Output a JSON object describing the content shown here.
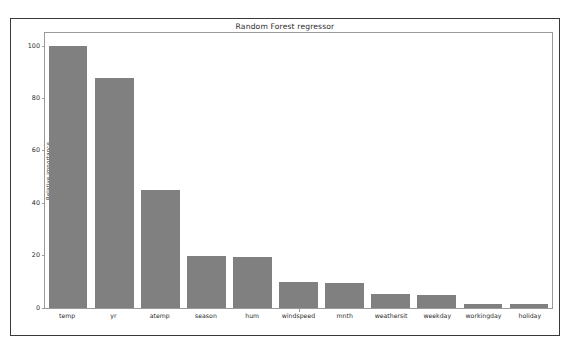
{
  "figure": {
    "title": "Random Forest regressor",
    "bar_color": "#808080",
    "frame_color": "#3a3a3a",
    "axes_color": "#9a9a9a",
    "background": "#ffffff"
  },
  "chart_data": {
    "type": "bar",
    "title": "Random Forest regressor",
    "xlabel": "",
    "ylabel": "Relative importance",
    "ylim": [
      0,
      105
    ],
    "yticks": [
      0,
      20,
      40,
      60,
      80,
      100
    ],
    "ytick_labels": [
      "0",
      "20",
      "40",
      "60",
      "80",
      "100"
    ],
    "grid": false,
    "legend": null,
    "categories": [
      "temp",
      "yr",
      "atemp",
      "season",
      "hum",
      "windspeed",
      "mnth",
      "weathersit",
      "weekday",
      "workingday",
      "holiday"
    ],
    "values": [
      100,
      88,
      45,
      20,
      19.5,
      10,
      9.5,
      5.5,
      5,
      1.5,
      1.5
    ]
  }
}
